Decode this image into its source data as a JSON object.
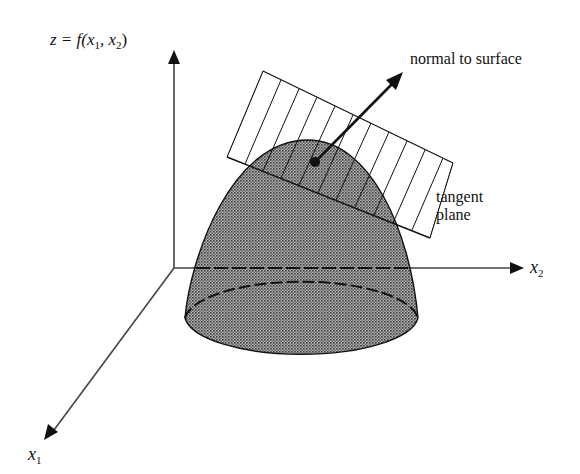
{
  "diagram": {
    "axes": {
      "z_label": "z = f(x",
      "z_label_parts": {
        "prefix": "z = f(x",
        "sub1": "1",
        "mid": ", x",
        "sub2": "2",
        "suffix": ")"
      },
      "x1_label": "x",
      "x1_sub": "1",
      "x2_label": "x",
      "x2_sub": "2"
    },
    "annotations": {
      "normal": "normal to surface",
      "tangent_line1": "tangent",
      "tangent_line2": "plane"
    },
    "colors": {
      "ink": "#111111",
      "surface_fill": "#8a8a8a",
      "background": "#ffffff"
    }
  }
}
